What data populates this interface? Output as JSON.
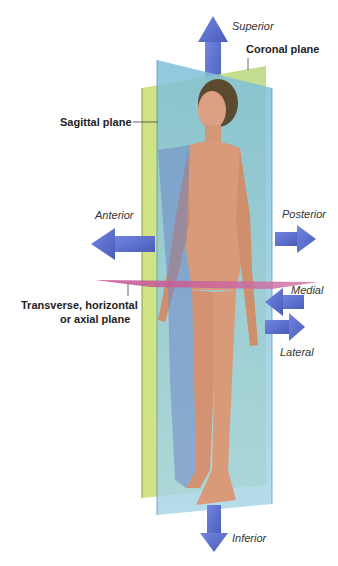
{
  "figure": {
    "planes": {
      "coronal": "Coronal plane",
      "sagittal": "Sagittal plane",
      "transverse_line1": "Transverse, horizontal",
      "transverse_line2": "or axial plane"
    },
    "directions": {
      "superior": "Superior",
      "inferior": "Inferior",
      "anterior": "Anterior",
      "posterior": "Posterior",
      "medial": "Medial",
      "lateral": "Lateral"
    },
    "colors": {
      "sagittal_plane": "#c8dc7a",
      "coronal_plane": "#8fc6dc",
      "transverse_plane": "#c0508a",
      "arrow": "#5a6fc8",
      "skin": "#d99a7a"
    }
  }
}
